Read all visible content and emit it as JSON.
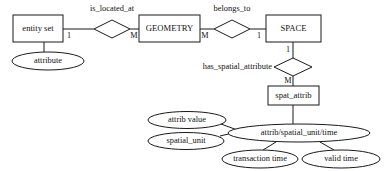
{
  "diagram": {
    "type": "entity-relationship-diagram",
    "colors": {
      "stroke": "#1a1a1a",
      "fill": "#ffffff",
      "text": "#111111",
      "background": "#ffffff"
    },
    "entities": [
      {
        "id": "entity_set",
        "label": "entity set",
        "x": 13,
        "y": 15,
        "w": 50,
        "h": 27
      },
      {
        "id": "geometry",
        "label": "GEOMETRY",
        "x": 139,
        "y": 15,
        "w": 61,
        "h": 27
      },
      {
        "id": "space",
        "label": "SPACE",
        "x": 266,
        "y": 15,
        "w": 55,
        "h": 27
      },
      {
        "id": "spat_attrib",
        "label": "spat_attrib",
        "x": 268,
        "y": 86,
        "w": 51,
        "h": 19
      }
    ],
    "relationships": [
      {
        "id": "is_located_at",
        "label": "is_located_at",
        "cx": 112,
        "cy": 29,
        "rx": 18,
        "ry": 9,
        "label_x": 112,
        "label_y": 9
      },
      {
        "id": "belongs_to",
        "label": "belongs_to",
        "cx": 232,
        "cy": 29,
        "rx": 18,
        "ry": 9,
        "label_x": 232,
        "label_y": 9
      },
      {
        "id": "has_spatial_attribute",
        "label": "has_spatial_attribute",
        "cx": 293,
        "cy": 67,
        "rx": 19,
        "ry": 9,
        "label_x": 272,
        "label_y": 67
      }
    ],
    "attributes": [
      {
        "id": "attribute",
        "label": "attribute",
        "cx": 48,
        "cy": 61,
        "rx": 36,
        "ry": 9
      },
      {
        "id": "attrib_value",
        "label": "attrib value",
        "cx": 187,
        "cy": 120,
        "rx": 39,
        "ry": 8.5
      },
      {
        "id": "spatial_unit",
        "label": "spatial_unit",
        "cx": 186,
        "cy": 141,
        "rx": 38,
        "ry": 8.5
      },
      {
        "id": "attrib_spatial_unit_time",
        "label": "attrib/spatial_unit/time",
        "cx": 299,
        "cy": 133,
        "rx": 71,
        "ry": 9
      },
      {
        "id": "transaction_time",
        "label": "transaction time",
        "cx": 260,
        "cy": 159,
        "rx": 38,
        "ry": 9
      },
      {
        "id": "valid_time",
        "label": "valid time",
        "cx": 341,
        "cy": 159,
        "rx": 39,
        "ry": 9
      }
    ],
    "cardinalities": [
      {
        "id": "card-entityset-islocatedat",
        "label": "1",
        "x": 69,
        "y": 36
      },
      {
        "id": "card-islocatedat-geometry",
        "label": "M",
        "x": 134,
        "y": 36
      },
      {
        "id": "card-geometry-belongsto",
        "label": "M",
        "x": 205,
        "y": 36
      },
      {
        "id": "card-belongsto-space",
        "label": "1",
        "x": 259,
        "y": 36
      },
      {
        "id": "card-space-hasspatialattribute",
        "label": "1",
        "x": 288,
        "y": 50
      },
      {
        "id": "card-hasspatialattribute-spatattrib",
        "label": "M",
        "x": 288,
        "y": 81
      }
    ],
    "connectors": [
      {
        "id": "conn-entityset-islocatedat",
        "d": "M 63 29 L 94 29"
      },
      {
        "id": "conn-islocatedat-geometry",
        "d": "M 130 29 L 139 29"
      },
      {
        "id": "conn-geometry-belongsto",
        "d": "M 200 29 L 214 29"
      },
      {
        "id": "conn-belongsto-space",
        "d": "M 250 29 L 266 29"
      },
      {
        "id": "conn-entityset-attribute",
        "d": "M 44 42 L 44 52"
      },
      {
        "id": "conn-space-hasspatialattribute",
        "d": "M 293 42 L 293 58"
      },
      {
        "id": "conn-hasspatialattribute-spatattrib",
        "d": "M 293 76 L 293 86"
      },
      {
        "id": "conn-spatattrib-attribspatialunittime",
        "d": "M 293 105 L 293 124"
      },
      {
        "id": "conn-attribvalue-center",
        "d": "M 221 124 L 240 131"
      },
      {
        "id": "conn-spatialunit-center",
        "d": "M 220 136 L 237 132"
      },
      {
        "id": "conn-center-transactiontime",
        "d": "M 276 142 L 263 150"
      },
      {
        "id": "conn-center-validtime",
        "d": "M 320 142 L 334 150"
      }
    ]
  }
}
